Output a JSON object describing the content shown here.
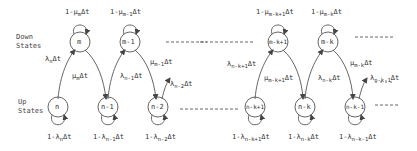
{
  "row_labels": {
    "down": [
      "Down",
      "States"
    ],
    "up": [
      "Up",
      "States"
    ]
  },
  "down_nodes": [
    {
      "id": "m",
      "x": 80,
      "y": 42
    },
    {
      "id": "m-1",
      "x": 130,
      "y": 42
    },
    {
      "id": "m-k+1",
      "x": 278,
      "y": 42
    },
    {
      "id": "m-k",
      "x": 328,
      "y": 42
    }
  ],
  "up_nodes": [
    {
      "id": "n",
      "x": 58,
      "y": 107
    },
    {
      "id": "n-1",
      "x": 108,
      "y": 107
    },
    {
      "id": "n-2",
      "x": 158,
      "y": 107
    },
    {
      "id": "n-k+1",
      "x": 255,
      "y": 107
    },
    {
      "id": "n-k",
      "x": 305,
      "y": 107
    },
    {
      "id": "n-k-1",
      "x": 355,
      "y": 107
    }
  ],
  "labels": {
    "self_down": [
      {
        "pre": "1-μ",
        "sub": "m",
        "post": "Δt"
      },
      {
        "pre": "1-μ",
        "sub": "m-1",
        "post": "Δt"
      },
      {
        "pre": "1-μ",
        "sub": "m-k+1",
        "post": "Δt"
      },
      {
        "pre": "1-μ",
        "sub": "m-k",
        "post": "Δt"
      }
    ],
    "self_up": [
      {
        "pre": "1-λ",
        "sub": "n",
        "post": "Δt"
      },
      {
        "pre": "1-λ",
        "sub": "n-1",
        "post": "Δt"
      },
      {
        "pre": "1-λ",
        "sub": "n-2",
        "post": "Δt"
      },
      {
        "pre": "1-λ",
        "sub": "n-k+1",
        "post": "Δt"
      },
      {
        "pre": "1-λ",
        "sub": "n-k",
        "post": "Δt"
      },
      {
        "pre": "1-λ",
        "sub": "n-k-1",
        "post": "Δt"
      }
    ],
    "failure": [
      {
        "pre": "λ",
        "sub": "n",
        "post": "Δt"
      },
      {
        "pre": "λ",
        "sub": "n-1",
        "post": "Δt"
      },
      {
        "pre": "λ",
        "sub": "n-2",
        "post": "Δt"
      },
      {
        "pre": "λ",
        "sub": "n-k+1",
        "post": "Δt"
      },
      {
        "pre": "λ",
        "sub": "n-k",
        "post": "Δt"
      },
      {
        "pre": "λ",
        "sub": "n-k-1",
        "post": "Δt"
      }
    ],
    "repair": [
      {
        "pre": "μ",
        "sub": "m",
        "post": "Δt"
      },
      {
        "pre": "μ",
        "sub": "m-1",
        "post": "Δt"
      },
      {
        "pre": "μ",
        "sub": "m-k+1",
        "post": "Δt"
      },
      {
        "pre": "μ",
        "sub": "m-k",
        "post": "Δt"
      }
    ]
  }
}
